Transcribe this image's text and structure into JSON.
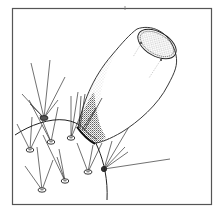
{
  "figure": {
    "title": "Line illustration of a flask-shaped structure emerging from a curved surface bearing radiating hair tufts",
    "frame": {
      "stroke": "#555555",
      "background": "#ffffff"
    },
    "ink_color": "#222222",
    "stipple_color": "#444444",
    "elements": {
      "vessel": "flask-shaped body with stippled shading and an open oval rim",
      "surface": "curved surface line",
      "hair_tufts": 8
    }
  }
}
